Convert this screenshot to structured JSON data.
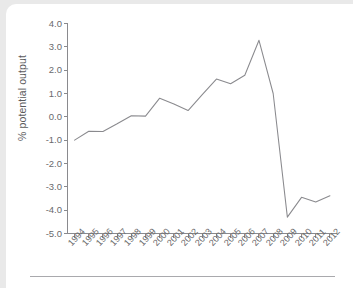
{
  "chart_data": {
    "type": "line",
    "title": "",
    "subtitle": "",
    "xlabel": "",
    "ylabel": "% potential output",
    "grid": false,
    "legend": false,
    "legend_position": "none",
    "line_color": "#8a8a8e",
    "categories": [
      "1994",
      "1995",
      "1996",
      "1997",
      "1998",
      "1999",
      "2000",
      "2001",
      "2002",
      "2003",
      "2004",
      "2005",
      "2006",
      "2007",
      "2008",
      "2009",
      "2010",
      "2011",
      "2012"
    ],
    "values": [
      -1.0,
      -0.62,
      -0.63,
      -0.3,
      0.05,
      0.03,
      0.8,
      0.55,
      0.27,
      0.95,
      1.62,
      1.42,
      1.78,
      3.28,
      1.0,
      -4.3,
      -3.45,
      -3.65,
      -3.38
    ],
    "series": [
      {
        "name": "Output gap",
        "values": [
          -1.0,
          -0.62,
          -0.63,
          -0.3,
          0.05,
          0.03,
          0.8,
          0.55,
          0.27,
          0.95,
          1.62,
          1.42,
          1.78,
          3.28,
          1.0,
          -4.3,
          -3.45,
          -3.65,
          -3.38
        ]
      }
    ],
    "ylim": [
      -5.0,
      4.0
    ],
    "ytick_labels": [
      "4.0",
      "3.0",
      "2.0",
      "1.0",
      "0.0",
      "-1.0",
      "-2.0",
      "-3.0",
      "-4.0",
      "-5.0"
    ],
    "ytick_values": [
      4.0,
      3.0,
      2.0,
      1.0,
      0.0,
      -1.0,
      -2.0,
      -3.0,
      -4.0,
      -5.0
    ],
    "xtick_labels": [
      "1994",
      "1995",
      "1996",
      "1997",
      "1998",
      "1999",
      "2000",
      "2001",
      "2002",
      "2003",
      "2004",
      "2005",
      "2006",
      "2007",
      "2008",
      "2009",
      "2010",
      "2011",
      "2012"
    ]
  },
  "figure": {
    "background_color": "#ffffff",
    "page_background_color": "#e9e9e9",
    "axis_color": "#8a8a8e",
    "text_color": "#6a6a6c"
  }
}
